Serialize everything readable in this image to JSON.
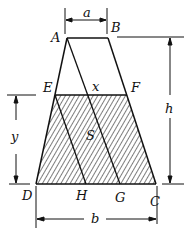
{
  "diagram": {
    "type": "geometry",
    "points": {
      "A": {
        "label": "A",
        "x": 67,
        "y": 38
      },
      "B": {
        "label": "B",
        "x": 108,
        "y": 38
      },
      "C": {
        "label": "C",
        "x": 156,
        "y": 184
      },
      "D": {
        "label": "D",
        "x": 36,
        "y": 184
      },
      "E": {
        "label": "E",
        "x": 55,
        "y": 95
      },
      "F": {
        "label": "F",
        "x": 127,
        "y": 95
      },
      "G": {
        "label": "G",
        "x": 120,
        "y": 184
      },
      "H": {
        "label": "H",
        "x": 86,
        "y": 184
      }
    },
    "dimensions": {
      "top": "a",
      "bottom": "b",
      "height": "h",
      "level": "y",
      "segment": "x",
      "area": "S"
    },
    "colors": {
      "stroke": "#111111",
      "background": "#ffffff"
    }
  }
}
